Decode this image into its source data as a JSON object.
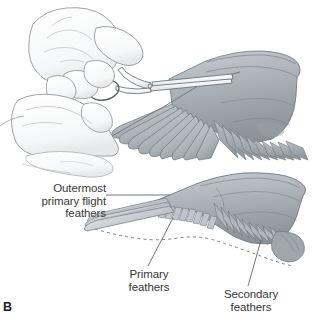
{
  "figure": {
    "panel_letter": "B",
    "caption_subject": "wing-clipping-procedure",
    "background_color": "#ffffff"
  },
  "labels": {
    "outermost": {
      "lines": [
        "Outermost",
        "primary flight",
        "feathers"
      ],
      "text": "Outermost\nprimary flight\nfeathers"
    },
    "primary": {
      "lines": [
        "Primary",
        "feathers"
      ],
      "text": "Primary\nfeathers"
    },
    "secondary": {
      "lines": [
        "Secondary",
        "feathers"
      ],
      "text": "Secondary\nfeathers"
    }
  },
  "colors": {
    "ink": "#5a6068",
    "ink_light": "#9aa0a6",
    "text": "#373737",
    "panel_letter": "#1d1d1d",
    "feather_light": "#cfd5d9",
    "feather_mid": "#b3bac0",
    "feather_dark": "#949ca3",
    "wing_body": "#a8aeb2",
    "wing_body_dark": "#8d9499",
    "skin": "#fdfdfd",
    "skin_shade": "#e9eaec",
    "metal": "#f4f5f6",
    "dashed": "#6e747a"
  },
  "panels": {
    "top": {
      "name": "hands-trimming-wing",
      "elements": [
        "left-hand-holding-bird",
        "right-hand-holding-scissors",
        "scissors",
        "outstretched-wing",
        "primary-feathers",
        "secondary-feathers"
      ]
    },
    "bottom": {
      "name": "clipped-wing-diagram",
      "elements": [
        "wing-outline",
        "outermost-primary-flight-feathers",
        "clipped-primary-feathers",
        "secondary-feathers",
        "dashed-original-feather-outline"
      ]
    }
  }
}
